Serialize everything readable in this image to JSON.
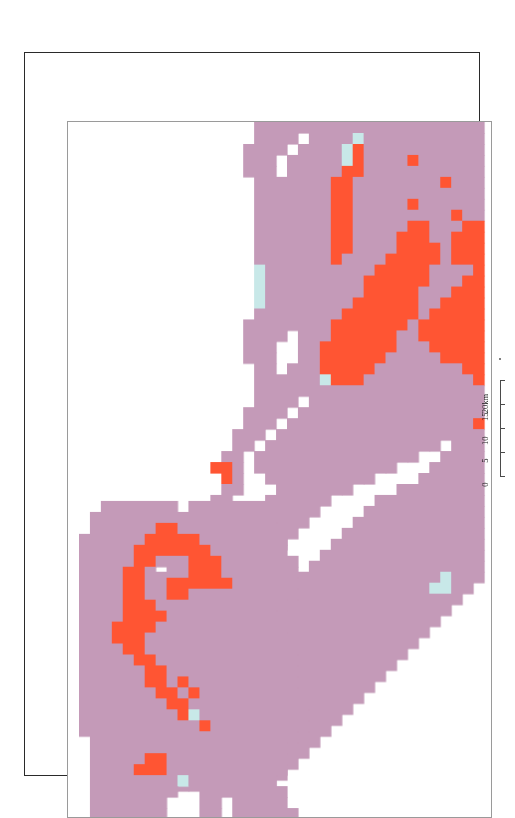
{
  "document": {
    "kind": "scanned-thematic-raster-map",
    "page_background": "#ffffff"
  },
  "frame": {
    "outer_border_color": "#2a2a2a",
    "inner_border_color": "#9a9a9a"
  },
  "legend_colors": {
    "class_purple": "#c49ab8",
    "class_orange": "#ff5533",
    "class_cyan": "#c8e8e8",
    "class_background": "#ffffff"
  },
  "scale_bar": {
    "name": "distance-scale",
    "orientation": "vertical",
    "unit": "km",
    "ticks": [
      {
        "value": "0",
        "km": 0
      },
      {
        "value": "5",
        "km": 5
      },
      {
        "value": "10",
        "km": 10
      },
      {
        "value": "15",
        "km": 15
      },
      {
        "value": "20km",
        "km": 20
      }
    ]
  },
  "chart_data": {
    "type": "heatmap",
    "title": "",
    "xlabel": "",
    "ylabel": "",
    "grid": false,
    "legend_position": "none",
    "cell_size_px": 11,
    "cols": 38,
    "rows": 63,
    "palette": {
      "0": "#ffffff",
      "1": "#c49ab8",
      "2": "#ff5533",
      "3": "#c8e8e8"
    },
    "matrix": [
      "00000000000000000111111111111111111111",
      "00000000000000000111101111311111111111",
      "00000000000000001111011113211111111111",
      "00000000000000001110111113211112111111",
      "00000000000000001110111112211111111111",
      "00000000000000000111111122111111112111",
      "00000000000000000111111122111111111111",
      "00000000000000000111111122111112111111",
      "00000000000000000111111122111111111211",
      "00000000000000000111111122111112211122",
      "00000000000000000111111122111122211222",
      "00000000000000000111111122111122221222",
      "00000000000000000111111121111222221222",
      "00000000000000000311111111112222211112",
      "00000000000000000311111111122222211122",
      "00000000000000000311111111122222111222",
      "00000000000000000311111111222222112222",
      "00000000000000000111111112222222122222",
      "00000000000000001111111122222221222222",
      "00000000000000001111011122222211222222",
      "00000000000000001110011222222211122222",
      "00000000000000001110011222222111112222",
      "00000000000000000110111222221111111122",
      "00000000000000000111111322211111111112",
      "00000000000000000111111111111111111111",
      "00000000000000000111101111111111111111",
      "00000000000000001111011111111111111111",
      "00000000000000001110111111111111111112",
      "00000000000000011101111111111111111111",
      "00000000000000011011111111111111110111",
      "00000000000000110111111111111111001111",
      "00000000000002210111111111111100011111",
      "00000000000000210011111111110000111111",
      "00000000000000110001111111000011111111",
      "00000000000001100011111100001111111111",
      "00000000000011000011111000011111111111",
      "00000000000010000011110000111111111111",
      "00000000000110000111100001111111111111",
      "00000000001100001111000011111111111111",
      "00000000011000011110000111111111111111",
      "00000000010000011100001111111111111111",
      "00000000110000111000011111111111113111",
      "00000001100001110000111111111111133110",
      "00000011000011100001111111111111111100",
      "00000110000111000011111111111111111000",
      "00001100001110000111111111111111110000",
      "00011000011100001111111111111111100000",
      "00011000111000011111111111111111000000",
      "00110001110000111111111111111110000000",
      "01100011100001111111111111111100000000",
      "00000111000011111111111111111000000000",
      "00001110000111111111111111110000000000",
      "00011100001111111111111111100000000000",
      "00111000011111111111111111000000000000",
      "01110000111111111111111110000000000000",
      "01100001111111111111111100000000000000",
      "00000011111111111111111000000000000000",
      "00000111111111111111110000000000000000",
      "00001111111111111111100000000000000000",
      "00011111111111111111000000000000000000",
      "00011111111111111110000000000000000000",
      "00000000000000000000000000000000000000",
      "00000000000000000000000000000000000000"
    ],
    "matrix_lower": [
      "00011111110111111100000000000000000000",
      "00111111111111111110000000000000000000",
      "00111111221111111110000000000000000000",
      "01111112222211111111000000000000000000",
      "01111122222221111111000000000000000000",
      "01111122111222111111100000000000000000",
      "01111221011222111111100000000000000000",
      "01111221122222211111100000000000000000",
      "01111221122111111111100000000000000000",
      "01111222111111111111000000000000000000",
      "01111222211111111110000000000000000000",
      "01112222111111111111000000000000000000",
      "01112221111111111111000000000000000000",
      "01111221111111111111100000000000000000",
      "01111122111111111111100000000000000000",
      "01111112211111111111100000000000000000",
      "01111112212111111111100000000000000000",
      "01111111221211111111100000000000000000",
      "01111111122111111111110000000000000000",
      "01111111112311111111110000000000000000",
      "01111111111121111111110000000000000000",
      "00111111111111111111100000000000000000",
      "00111111111111111111000000000000000000",
      "00111112211111111111000000000000000000",
      "00111122211111111111000000000000000000",
      "00111111113111111110000000000000000000",
      "00111111110011111111000000000000000000",
      "00111111100011011111000000000000000000",
      "00111111100011011111100000000000000000",
      "00111110011011011111100000000000000000",
      "00111100111011011111100000000000000000",
      "00111110011011011111100000000000000000",
      "00111111111112112211110000000000000000",
      "00111111111111111111110000000000000000",
      "00011111111111111111111000000000000000",
      "00001111111111111111111000000000000000",
      "00000011111111111111111000000000000000",
      "00000001111111111111110000000000000000",
      "00000000000000000000000000000000000000"
    ]
  }
}
